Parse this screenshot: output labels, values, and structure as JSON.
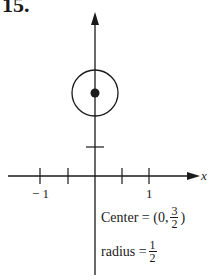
{
  "problem": {
    "number": "15."
  },
  "axes": {
    "x_label": "x",
    "tick_labels": {
      "neg1": "− 1",
      "pos1": "1"
    }
  },
  "annotation": {
    "center_prefix": "Center = (0,",
    "center_num": "3",
    "center_den": "2",
    "center_suffix": ")",
    "radius_prefix": "radius =",
    "radius_num": "1",
    "radius_den": "2"
  },
  "figure": {
    "shape": "circle",
    "center": [
      0,
      1.5
    ],
    "radius": 0.5,
    "stroke_color": "#1a1a1a"
  }
}
